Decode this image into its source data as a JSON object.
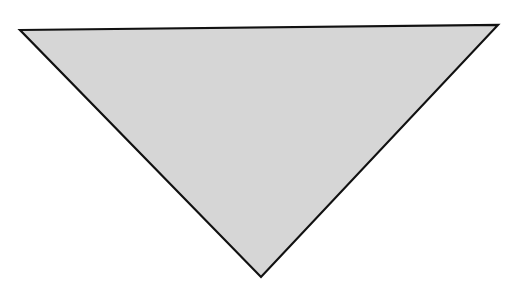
{
  "diagram": {
    "background": "#ffffff",
    "shapes": [
      {
        "type": "triangle",
        "orientation": "inverted",
        "points": [
          [
            20,
            30
          ],
          [
            498,
            25
          ],
          [
            261,
            277
          ]
        ],
        "fill": "#d6d6d6",
        "stroke": "#111111",
        "stroke_width": 2.2
      }
    ]
  }
}
